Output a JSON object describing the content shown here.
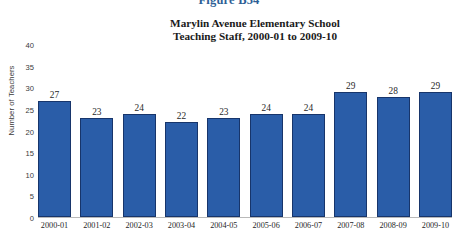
{
  "figure": {
    "label": "Figure B54"
  },
  "chart_data": {
    "type": "bar",
    "title": "Marylin Avenue Elementary School Teaching Staff, 2000-01 to 2009-10",
    "title_lines": [
      "Marylin Avenue Elementary School",
      "Teaching Staff, 2000-01 to 2009-10"
    ],
    "xlabel": "",
    "ylabel": "Number of Teachers",
    "categories": [
      "2000-01",
      "2001-02",
      "2002-03",
      "2003-04",
      "2004-05",
      "2005-06",
      "2006-07",
      "2007-08",
      "2008-09",
      "2009-10"
    ],
    "values": [
      27,
      23,
      24,
      22,
      23,
      24,
      24,
      29,
      28,
      29
    ],
    "data_labels": [
      "27",
      "23",
      "24",
      "22",
      "23",
      "24",
      "24",
      "29",
      "28",
      "29"
    ],
    "ylim": [
      0,
      40
    ],
    "ytick_step": 5,
    "ytick_labels": [
      "0",
      "5",
      "10",
      "15",
      "20",
      "25",
      "30",
      "35",
      "40"
    ],
    "grid": false,
    "legend": false,
    "bar_color": "#2a5da8",
    "bar_border_color": "#17356b",
    "figure_label_color": "#2e5f96",
    "background_color": "#ffffff"
  }
}
